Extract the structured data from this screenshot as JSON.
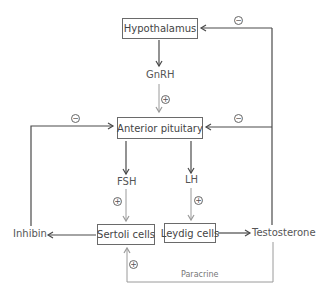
{
  "diagram": {
    "nodes": {
      "hypothalamus": "Hypothalamus",
      "anterior_pituitary": "Anterior pituitary",
      "sertoli": "Sertoli cells",
      "leydig": "Leydig cells"
    },
    "labels": {
      "gnrh": "GnRH",
      "fsh": "FSH",
      "lh": "LH",
      "inhibin": "Inhibin",
      "testosterone": "Testosterone",
      "paracrine": "Paracrine"
    },
    "signs": {
      "plus": "+",
      "minus": "−"
    },
    "edges": [
      {
        "from": "Hypothalamus",
        "to": "GnRH"
      },
      {
        "from": "GnRH",
        "to": "Anterior pituitary",
        "effect": "+"
      },
      {
        "from": "Anterior pituitary",
        "to": "FSH"
      },
      {
        "from": "Anterior pituitary",
        "to": "LH"
      },
      {
        "from": "FSH",
        "to": "Sertoli cells",
        "effect": "+"
      },
      {
        "from": "LH",
        "to": "Leydig cells",
        "effect": "+"
      },
      {
        "from": "Sertoli cells",
        "to": "Inhibin"
      },
      {
        "from": "Leydig cells",
        "to": "Testosterone"
      },
      {
        "from": "Inhibin",
        "to": "Anterior pituitary",
        "effect": "−"
      },
      {
        "from": "Testosterone",
        "to": "Anterior pituitary",
        "effect": "−"
      },
      {
        "from": "Testosterone",
        "to": "Hypothalamus",
        "effect": "−"
      },
      {
        "from": "Testosterone",
        "to": "Sertoli cells",
        "effect": "+",
        "label": "Paracrine"
      }
    ]
  },
  "colors": {
    "dark_line": "#4a4a4a",
    "light_line": "#9a9a9a",
    "text": "#444444"
  }
}
